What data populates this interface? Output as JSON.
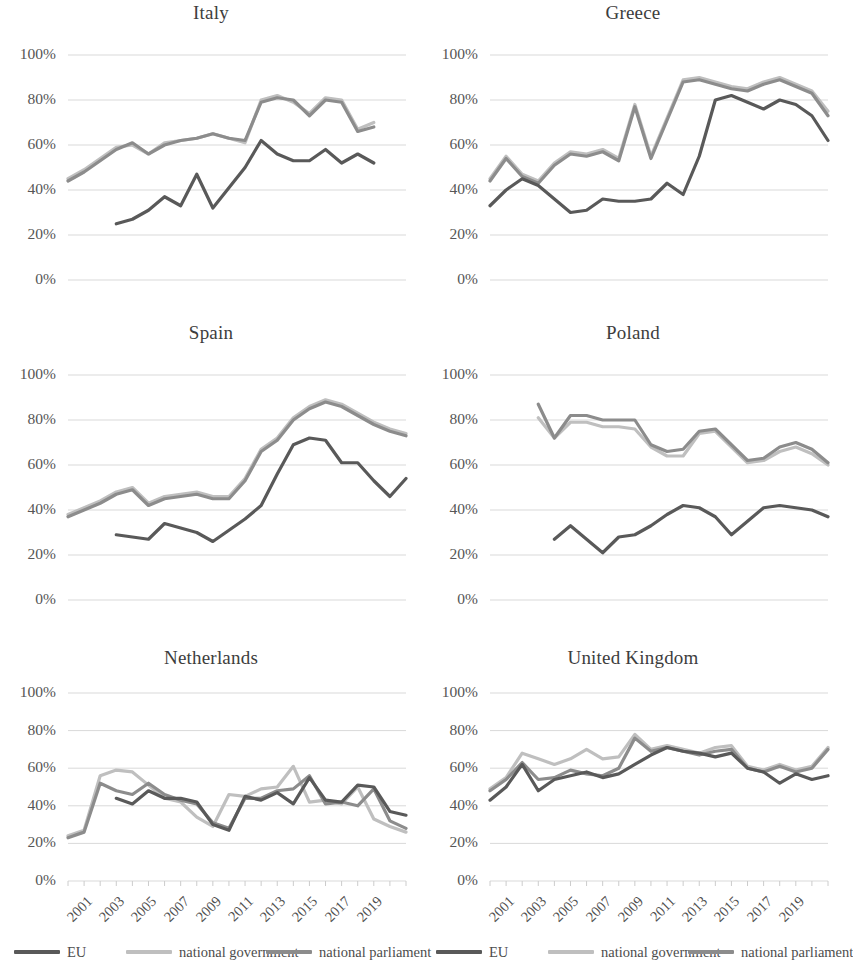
{
  "figure": {
    "series_styles": {
      "eu": "#595959",
      "national_government": "#bfbfbf",
      "national_parliament": "#8c8c8c",
      "gridline": "#d9d9d9"
    },
    "legend": {
      "items": [
        {
          "label": "EU",
          "key": "eu",
          "color": "#595959"
        },
        {
          "label": "national government",
          "key": "national_government",
          "color": "#bfbfbf"
        },
        {
          "label": "national parliament",
          "key": "national_parliament",
          "color": "#8c8c8c"
        }
      ]
    },
    "y_ticks": [
      "0%",
      "20%",
      "40%",
      "60%",
      "80%",
      "100%"
    ],
    "x_ticks": [
      "2001",
      "2003",
      "2005",
      "2007",
      "2009",
      "2011",
      "2013",
      "2015",
      "2017",
      "2019"
    ]
  },
  "chart_data": [
    {
      "type": "line",
      "title": "Italy",
      "xlabel": "",
      "ylabel": "",
      "ylim": [
        0,
        100
      ],
      "xlim": [
        2000,
        2020
      ],
      "grid": true,
      "legend_position": "bottom",
      "x": [
        2000,
        2001,
        2002,
        2003,
        2004,
        2005,
        2006,
        2007,
        2008,
        2009,
        2010,
        2011,
        2012,
        2013,
        2014,
        2015,
        2016,
        2017,
        2018,
        2019,
        2020
      ],
      "series": [
        {
          "name": "EU",
          "values": [
            null,
            null,
            null,
            25,
            27,
            30,
            34,
            37,
            33,
            47,
            32,
            41,
            49,
            56,
            62,
            57,
            53,
            53,
            58,
            52,
            56,
            52
          ]
        },
        {
          "name": "national government",
          "values": [
            45,
            48,
            53,
            59,
            61,
            56,
            60,
            61,
            60,
            62,
            65,
            64,
            62,
            62,
            80,
            82,
            79,
            80,
            74,
            75,
            81,
            80,
            69,
            67,
            70
          ]
        },
        {
          "name": "national parliament",
          "values": [
            44,
            47,
            52,
            57,
            61,
            56,
            59,
            61,
            60,
            63,
            65,
            63,
            61,
            62,
            79,
            82,
            80,
            79,
            73,
            74,
            81,
            80,
            68,
            66,
            68
          ]
        }
      ],
      "series_order": [
        "national government",
        "national parliament",
        "EU"
      ],
      "points": {
        "EU": [
          null,
          null,
          null,
          25,
          27,
          31,
          37,
          33,
          47,
          32,
          41,
          50,
          62,
          56,
          53,
          53,
          58,
          52,
          56,
          52
        ],
        "national government": [
          45,
          49,
          54,
          59,
          60,
          56,
          61,
          62,
          63,
          65,
          63,
          61,
          80,
          82,
          79,
          74,
          81,
          80,
          67,
          70
        ],
        "national parliament": [
          44,
          48,
          53,
          58,
          61,
          56,
          60,
          62,
          63,
          65,
          63,
          62,
          79,
          81,
          80,
          73,
          80,
          79,
          66,
          68
        ]
      }
    },
    {
      "type": "line",
      "title": "Greece",
      "xlabel": "",
      "ylabel": "",
      "ylim": [
        0,
        100
      ],
      "xlim": [
        2000,
        2020
      ],
      "grid": true,
      "legend_position": "bottom",
      "points": {
        "EU": [
          33,
          40,
          45,
          42,
          36,
          30,
          31,
          36,
          35,
          35,
          36,
          43,
          38,
          55,
          80,
          82,
          79,
          76,
          80,
          78,
          73,
          62
        ],
        "national government": [
          45,
          55,
          47,
          44,
          52,
          57,
          56,
          58,
          54,
          78,
          55,
          72,
          89,
          90,
          88,
          86,
          85,
          88,
          90,
          87,
          84,
          75
        ],
        "national parliament": [
          44,
          54,
          46,
          43,
          51,
          56,
          55,
          57,
          53,
          77,
          54,
          71,
          88,
          89,
          87,
          85,
          84,
          87,
          89,
          86,
          83,
          73
        ]
      }
    },
    {
      "type": "line",
      "title": "Spain",
      "xlabel": "",
      "ylabel": "",
      "ylim": [
        0,
        100
      ],
      "xlim": [
        2000,
        2020
      ],
      "grid": true,
      "legend_position": "bottom",
      "points": {
        "EU": [
          null,
          null,
          null,
          29,
          28,
          27,
          34,
          32,
          30,
          26,
          31,
          36,
          42,
          56,
          69,
          72,
          71,
          61,
          61,
          53,
          46,
          54,
          50
        ],
        "national government": [
          38,
          41,
          44,
          48,
          50,
          43,
          46,
          47,
          48,
          46,
          46,
          54,
          67,
          72,
          81,
          86,
          89,
          87,
          83,
          79,
          76,
          74,
          79,
          76
        ],
        "national parliament": [
          37,
          40,
          43,
          47,
          49,
          42,
          45,
          46,
          47,
          45,
          45,
          53,
          66,
          71,
          80,
          85,
          88,
          86,
          82,
          78,
          75,
          73,
          78,
          75
        ]
      }
    },
    {
      "type": "line",
      "title": "Poland",
      "xlabel": "",
      "ylabel": "",
      "ylim": [
        0,
        100
      ],
      "xlim": [
        2000,
        2020
      ],
      "grid": true,
      "legend_position": "bottom",
      "points": {
        "EU": [
          null,
          null,
          null,
          null,
          27,
          33,
          27,
          21,
          28,
          29,
          33,
          38,
          42,
          41,
          37,
          29,
          35,
          41,
          42,
          41,
          40,
          37
        ],
        "national government": [
          null,
          null,
          null,
          81,
          72,
          79,
          79,
          77,
          77,
          76,
          68,
          64,
          64,
          74,
          75,
          68,
          61,
          62,
          66,
          68,
          65,
          60
        ],
        "national parliament": [
          null,
          null,
          null,
          87,
          72,
          82,
          82,
          80,
          80,
          80,
          69,
          66,
          67,
          75,
          76,
          69,
          62,
          63,
          68,
          70,
          67,
          61
        ]
      }
    },
    {
      "type": "line",
      "title": "Netherlands",
      "xlabel": "",
      "ylabel": "",
      "ylim": [
        0,
        100
      ],
      "xlim": [
        2000,
        2020
      ],
      "grid": true,
      "legend_position": "bottom",
      "points": {
        "EU": [
          null,
          null,
          null,
          44,
          41,
          48,
          44,
          44,
          42,
          30,
          27,
          45,
          43,
          47,
          41,
          55,
          43,
          42,
          51,
          50,
          37,
          35,
          38
        ],
        "national government": [
          24,
          27,
          56,
          59,
          58,
          51,
          44,
          42,
          34,
          29,
          46,
          45,
          49,
          50,
          61,
          42,
          43,
          41,
          50,
          33,
          29,
          26,
          36
        ],
        "national parliament": [
          23,
          26,
          52,
          48,
          46,
          52,
          46,
          43,
          41,
          31,
          28,
          44,
          44,
          48,
          49,
          56,
          41,
          42,
          40,
          49,
          32,
          28,
          25,
          33
        ]
      }
    },
    {
      "type": "line",
      "title": "United Kingdom",
      "xlabel": "",
      "ylabel": "",
      "ylim": [
        0,
        100
      ],
      "xlim": [
        2000,
        2020
      ],
      "grid": true,
      "legend_position": "bottom",
      "points": {
        "EU": [
          43,
          50,
          62,
          48,
          54,
          56,
          58,
          55,
          57,
          62,
          67,
          71,
          69,
          68,
          66,
          68,
          60,
          58,
          52,
          57,
          54,
          56
        ],
        "national government": [
          49,
          55,
          68,
          65,
          62,
          65,
          70,
          65,
          66,
          78,
          70,
          72,
          70,
          68,
          71,
          72,
          61,
          59,
          62,
          59,
          61,
          71
        ],
        "national parliament": [
          48,
          54,
          63,
          54,
          55,
          59,
          57,
          56,
          60,
          76,
          69,
          71,
          69,
          67,
          69,
          70,
          60,
          58,
          61,
          58,
          60,
          70
        ]
      }
    }
  ]
}
